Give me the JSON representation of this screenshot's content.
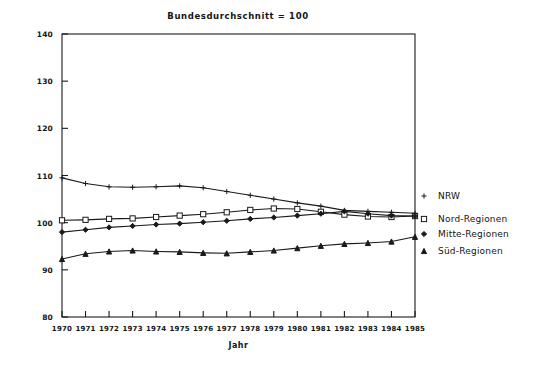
{
  "chart_data": {
    "type": "line",
    "title": "Bundesdurchschnitt = 100",
    "xlabel": "Jahr",
    "ylabel": "",
    "categories": [
      "1970",
      "1971",
      "1972",
      "1973",
      "1974",
      "1975",
      "1976",
      "1977",
      "1978",
      "1979",
      "1980",
      "1981",
      "1982",
      "1983",
      "1984",
      "1985"
    ],
    "x": [
      1970,
      1971,
      1972,
      1973,
      1974,
      1975,
      1976,
      1977,
      1978,
      1979,
      1980,
      1981,
      1982,
      1983,
      1984,
      1985
    ],
    "xlim": [
      1970,
      1985
    ],
    "ylim": [
      80,
      140
    ],
    "yticks": [
      80,
      90,
      100,
      110,
      120,
      130,
      140
    ],
    "xticks": [
      "1970",
      "1971",
      "1972",
      "1973",
      "1974",
      "1975",
      "1976",
      "1977",
      "1978",
      "1979",
      "1980",
      "1981",
      "1982",
      "1983",
      "1984",
      "1985"
    ],
    "grid": false,
    "legend_position": "right",
    "series": [
      {
        "name": "NRW",
        "marker": "plus",
        "values": [
          109.5,
          108.3,
          107.6,
          107.5,
          107.6,
          107.8,
          107.4,
          106.6,
          105.8,
          105.0,
          104.2,
          103.5,
          102.6,
          102.4,
          102.2,
          102.0
        ]
      },
      {
        "name": "Nord-Regionen",
        "marker": "square",
        "values": [
          100.5,
          100.6,
          100.8,
          100.9,
          101.2,
          101.5,
          101.8,
          102.2,
          102.7,
          103.0,
          102.9,
          102.3,
          101.7,
          101.3,
          101.2,
          101.4
        ]
      },
      {
        "name": "Mitte-Regionen",
        "marker": "diamond",
        "values": [
          98.0,
          98.5,
          99.0,
          99.3,
          99.6,
          99.8,
          100.1,
          100.4,
          100.8,
          101.1,
          101.5,
          101.9,
          102.4,
          101.9,
          101.5,
          101.4
        ]
      },
      {
        "name": "Süd-Regionen",
        "marker": "triangle",
        "values": [
          92.3,
          93.4,
          93.9,
          94.1,
          93.9,
          93.8,
          93.6,
          93.5,
          93.8,
          94.1,
          94.6,
          95.1,
          95.5,
          95.7,
          96.0,
          97.0
        ]
      }
    ],
    "legend": [
      {
        "label": "NRW",
        "marker": "plus"
      },
      {
        "label": "Nord-Regionen",
        "marker": "square"
      },
      {
        "label": "Mitte-Regionen",
        "marker": "diamond"
      },
      {
        "label": "Süd-Regionen",
        "marker": "triangle"
      }
    ]
  }
}
